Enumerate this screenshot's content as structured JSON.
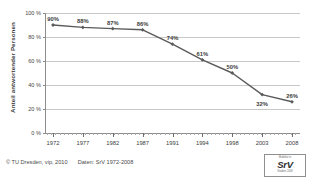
{
  "chart_data": {
    "type": "line",
    "title": "",
    "xlabel": "",
    "ylabel": "Anteil antwortender Personen",
    "categories": [
      "1972",
      "1977",
      "1982",
      "1987",
      "1991",
      "1994",
      "1998",
      "2003",
      "2008"
    ],
    "values": [
      90,
      88,
      87,
      86,
      74,
      61,
      50,
      32,
      26
    ],
    "point_labels": [
      "90%",
      "88%",
      "87%",
      "86%",
      "74%",
      "61%",
      "50%",
      "32%",
      "26%"
    ],
    "ylim": [
      0,
      100
    ],
    "ytick_values": [
      0,
      20,
      40,
      60,
      80,
      100
    ],
    "ytick_labels": [
      "0 %",
      "20 %",
      "40 %",
      "60 %",
      "80 %",
      "100 %"
    ],
    "grid": true,
    "legend": "none",
    "series_color": "#5a5a5a",
    "grid_color": "#c8c8c8",
    "axis_color": "#8c8c8c",
    "label_color": "#3d3d3d",
    "label_positions": [
      "above",
      "above",
      "above",
      "above",
      "above",
      "above",
      "above",
      "below",
      "above"
    ]
  },
  "footer": {
    "copyright": "© TU Dresden, vip, 2010",
    "source": "Daten: SrV 1972-2008"
  },
  "logo": {
    "top_text": "Mobilität in",
    "main_text": "SrV",
    "bottom_text": "Städten 2008",
    "alt": "srv-logo"
  }
}
